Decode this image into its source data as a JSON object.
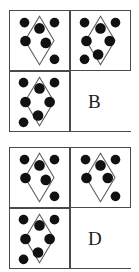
{
  "page": {
    "background_color": "#ffffff",
    "border_color": "#4a4a4a",
    "dot_color": "#111111",
    "diamond_stroke_color": "#5a5a5a"
  },
  "options": [
    {
      "id": "option-b",
      "label": "B",
      "cells": [
        {
          "id": "b-cell-1",
          "position": "top-left",
          "kind": "figure",
          "shape": "diamond",
          "diamond": {
            "cx": 30.5,
            "cy": 30.5,
            "rx": 15,
            "ry": 25
          },
          "dot_count": 6,
          "dots": [
            {
              "cx": 15,
              "cy": 12,
              "r": 5
            },
            {
              "cx": 46,
              "cy": 12,
              "r": 5
            },
            {
              "cx": 30.5,
              "cy": 18,
              "r": 5.5
            },
            {
              "cx": 16,
              "cy": 31,
              "r": 5.5
            },
            {
              "cx": 37,
              "cy": 33,
              "r": 5.5
            },
            {
              "cx": 46,
              "cy": 50,
              "r": 5
            }
          ]
        },
        {
          "id": "b-cell-2",
          "position": "top-right",
          "kind": "figure",
          "shape": "diamond",
          "diamond": {
            "cx": 30.5,
            "cy": 30.5,
            "rx": 15,
            "ry": 25
          },
          "dot_count": 7,
          "dots": [
            {
              "cx": 14,
              "cy": 12,
              "r": 5
            },
            {
              "cx": 46,
              "cy": 12,
              "r": 5
            },
            {
              "cx": 30.5,
              "cy": 18,
              "r": 5.5
            },
            {
              "cx": 16,
              "cy": 31,
              "r": 5.5
            },
            {
              "cx": 40,
              "cy": 31,
              "r": 5.5
            },
            {
              "cx": 28,
              "cy": 45,
              "r": 5.5
            },
            {
              "cx": 14,
              "cy": 50,
              "r": 5
            }
          ]
        },
        {
          "id": "b-cell-3",
          "position": "bottom-left",
          "kind": "figure",
          "shape": "diamond",
          "diamond": {
            "cx": 30.5,
            "cy": 30.5,
            "rx": 15,
            "ry": 25
          },
          "dot_count": 7,
          "dots": [
            {
              "cx": 14,
              "cy": 11,
              "r": 5
            },
            {
              "cx": 46,
              "cy": 11,
              "r": 5
            },
            {
              "cx": 30.5,
              "cy": 17,
              "r": 5.5
            },
            {
              "cx": 16,
              "cy": 31,
              "r": 5.5
            },
            {
              "cx": 41,
              "cy": 31,
              "r": 5.5
            },
            {
              "cx": 29,
              "cy": 45,
              "r": 5.5
            },
            {
              "cx": 14,
              "cy": 52,
              "r": 5
            }
          ]
        },
        {
          "id": "b-cell-4",
          "position": "bottom-right",
          "kind": "label",
          "label": "B"
        }
      ]
    },
    {
      "id": "option-d",
      "label": "D",
      "cells": [
        {
          "id": "d-cell-1",
          "position": "top-left",
          "kind": "figure",
          "shape": "diamond",
          "diamond": {
            "cx": 30.5,
            "cy": 30.5,
            "rx": 15,
            "ry": 25
          },
          "dot_count": 6,
          "dots": [
            {
              "cx": 15,
              "cy": 12,
              "r": 5
            },
            {
              "cx": 46,
              "cy": 12,
              "r": 5
            },
            {
              "cx": 30.5,
              "cy": 18,
              "r": 5.5
            },
            {
              "cx": 16,
              "cy": 31,
              "r": 5.5
            },
            {
              "cx": 37,
              "cy": 33,
              "r": 5.5
            },
            {
              "cx": 46,
              "cy": 50,
              "r": 5
            }
          ]
        },
        {
          "id": "d-cell-2",
          "position": "top-right",
          "kind": "figure",
          "shape": "diamond",
          "diamond": {
            "cx": 30.5,
            "cy": 30.5,
            "rx": 15,
            "ry": 25
          },
          "dot_count": 6,
          "dots": [
            {
              "cx": 15,
              "cy": 12,
              "r": 5
            },
            {
              "cx": 46,
              "cy": 12,
              "r": 5
            },
            {
              "cx": 30.5,
              "cy": 18,
              "r": 5.5
            },
            {
              "cx": 16,
              "cy": 31,
              "r": 5.5
            },
            {
              "cx": 38,
              "cy": 31,
              "r": 5.5
            },
            {
              "cx": 46,
              "cy": 50,
              "r": 5
            }
          ]
        },
        {
          "id": "d-cell-3",
          "position": "bottom-left",
          "kind": "figure",
          "shape": "diamond",
          "diamond": {
            "cx": 30.5,
            "cy": 30.5,
            "rx": 15,
            "ry": 25
          },
          "dot_count": 7,
          "dots": [
            {
              "cx": 14,
              "cy": 11,
              "r": 5
            },
            {
              "cx": 46,
              "cy": 11,
              "r": 5
            },
            {
              "cx": 30.5,
              "cy": 17,
              "r": 5.5
            },
            {
              "cx": 16,
              "cy": 31,
              "r": 5.5
            },
            {
              "cx": 41,
              "cy": 31,
              "r": 5.5
            },
            {
              "cx": 29,
              "cy": 45,
              "r": 5.5
            },
            {
              "cx": 14,
              "cy": 52,
              "r": 5
            }
          ]
        },
        {
          "id": "d-cell-4",
          "position": "bottom-right",
          "kind": "label",
          "label": "D"
        }
      ]
    }
  ]
}
